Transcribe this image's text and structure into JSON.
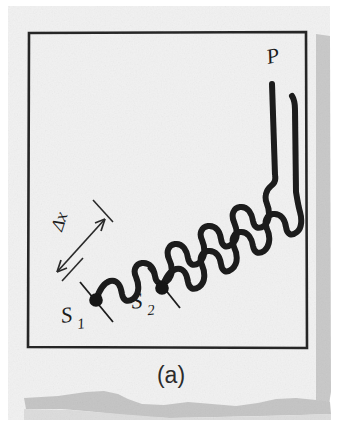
{
  "figure": {
    "caption": "(a)",
    "background_color": "#f1f1f1",
    "page_color": "#ffffff",
    "ink_color": "#1b1b1b",
    "shadow_color": "#c6c6c6",
    "frame": {
      "name": "figure-border-rectangle",
      "stroke_color": "#262626",
      "stroke_width": 2.6,
      "left": 28,
      "top": 32,
      "right": 306,
      "bottom": 348
    },
    "labels": [
      {
        "id": "P",
        "text": "P",
        "x": 268,
        "y": 62,
        "rotation": -12,
        "font_size": 20,
        "style": "italic-serif"
      },
      {
        "id": "S1",
        "text": "S",
        "sub": "1",
        "x": 70,
        "y": 322,
        "rotation": -8,
        "font_size": 20,
        "style": "italic-serif"
      },
      {
        "id": "S2",
        "text": "S",
        "sub": "2",
        "x": 140,
        "y": 308,
        "rotation": -6,
        "font_size": 20,
        "style": "italic-serif"
      },
      {
        "id": "dx",
        "text": "Δx",
        "x": 62,
        "y": 232,
        "rotation": -72,
        "font_size": 17,
        "style": "italic-serif"
      }
    ],
    "sources": [
      {
        "id": "S1",
        "label": "S1",
        "x": 96,
        "y": 300,
        "dot_radius": 6.5
      },
      {
        "id": "S2",
        "label": "S2",
        "x": 162,
        "y": 288,
        "dot_radius": 6.5
      }
    ],
    "observation_point": {
      "id": "P",
      "label": "P",
      "x": 272,
      "y": 80
    },
    "path_difference_marker": {
      "name": "delta-x-arrow",
      "label": "Δx",
      "arrow_from_x": 58,
      "arrow_from_y": 270,
      "arrow_to_x": 104,
      "arrow_to_y": 220,
      "tick_lines": 2
    },
    "waves": [
      {
        "id": "wave-from-S1",
        "source": "S1",
        "start_x": 96,
        "start_y": 300,
        "end_x": 270,
        "end_y": 84,
        "amplitude": 13,
        "wavelength": 31,
        "stroke_width": 6,
        "phase_deg": 0
      },
      {
        "id": "wave-from-S2",
        "source": "S2",
        "start_x": 162,
        "start_y": 288,
        "end_x": 296,
        "end_y": 96,
        "amplitude": 13,
        "wavelength": 31,
        "stroke_width": 6,
        "phase_deg": 0
      }
    ]
  }
}
